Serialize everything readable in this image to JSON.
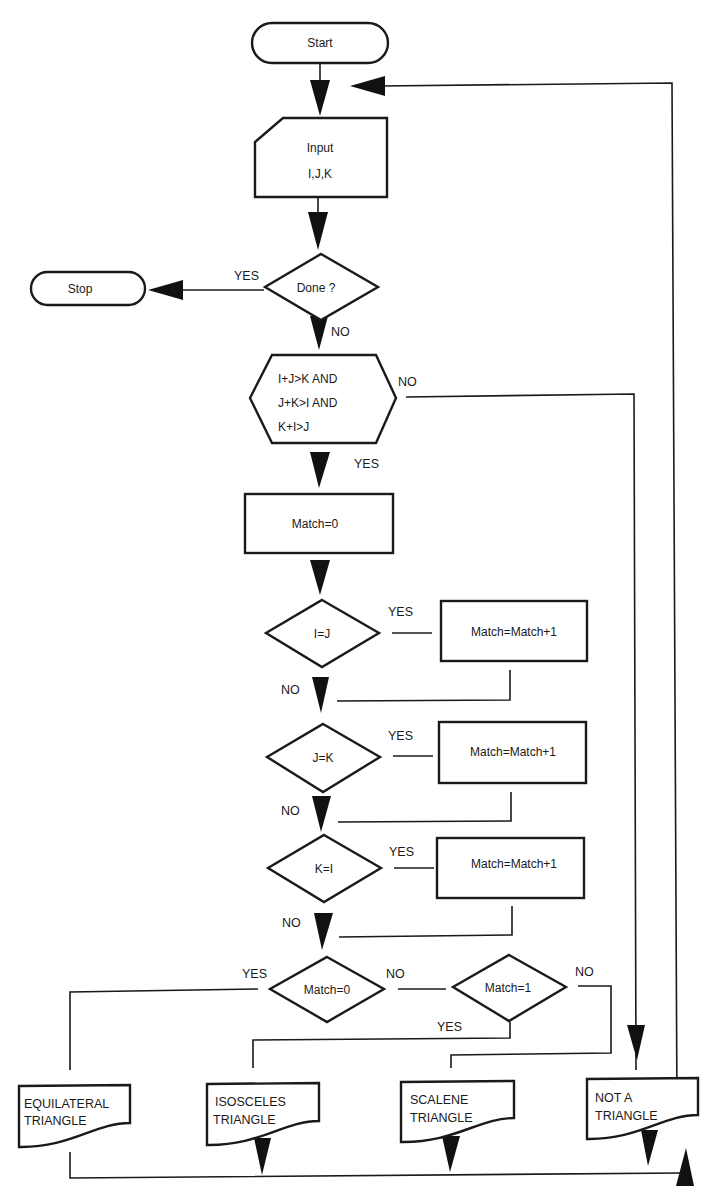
{
  "diagram": {
    "type": "flowchart",
    "colors": {
      "stroke": "#1a1a1a",
      "background": "#ffffff"
    },
    "nodes": {
      "start": {
        "shape": "terminator",
        "label": "Start"
      },
      "input": {
        "shape": "manual-input",
        "line1": "Input",
        "line2": "I,J,K"
      },
      "done": {
        "shape": "decision",
        "label": "Done ?"
      },
      "stop": {
        "shape": "terminator",
        "label": "Stop"
      },
      "triangle_check": {
        "shape": "preparation",
        "line1": "I+J>K AND",
        "line2": "J+K>I AND",
        "line3": "K+I>J"
      },
      "match_init": {
        "shape": "process",
        "label": "Match=0"
      },
      "ij": {
        "shape": "decision",
        "label": "I=J"
      },
      "inc1": {
        "shape": "process",
        "label": "Match=Match+1"
      },
      "jk": {
        "shape": "decision",
        "label": "J=K"
      },
      "inc2": {
        "shape": "process",
        "label": "Match=Match+1"
      },
      "ki": {
        "shape": "decision",
        "label": "K=I"
      },
      "inc3": {
        "shape": "process",
        "label": "Match=Match+1"
      },
      "match0": {
        "shape": "decision",
        "label": "Match=0"
      },
      "match1": {
        "shape": "decision",
        "label": "Match=1"
      },
      "equilateral": {
        "shape": "document",
        "line1": "EQUILATERAL",
        "line2": "TRIANGLE"
      },
      "isosceles": {
        "shape": "document",
        "line1": "ISOSCELES",
        "line2": "TRIANGLE"
      },
      "scalene": {
        "shape": "document",
        "line1": "SCALENE",
        "line2": "TRIANGLE"
      },
      "not_triangle": {
        "shape": "document",
        "line1": "NOT A",
        "line2": "TRIANGLE"
      }
    },
    "edge_labels": {
      "done_yes": "YES",
      "done_no": "NO",
      "check_no": "NO",
      "check_yes": "YES",
      "ij_yes": "YES",
      "ij_no": "NO",
      "jk_yes": "YES",
      "jk_no": "NO",
      "ki_yes": "YES",
      "ki_no": "NO",
      "match0_yes": "YES",
      "match0_no": "NO",
      "match1_yes": "YES",
      "match1_no": "NO"
    },
    "edges": [
      {
        "from": "start",
        "to": "input"
      },
      {
        "from": "input",
        "to": "done"
      },
      {
        "from": "done",
        "to": "stop",
        "label": "YES"
      },
      {
        "from": "done",
        "to": "triangle_check",
        "label": "NO"
      },
      {
        "from": "triangle_check",
        "to": "not_triangle",
        "label": "NO"
      },
      {
        "from": "triangle_check",
        "to": "match_init",
        "label": "YES"
      },
      {
        "from": "match_init",
        "to": "ij"
      },
      {
        "from": "ij",
        "to": "inc1",
        "label": "YES"
      },
      {
        "from": "ij",
        "to": "jk",
        "label": "NO"
      },
      {
        "from": "inc1",
        "to": "jk"
      },
      {
        "from": "jk",
        "to": "inc2",
        "label": "YES"
      },
      {
        "from": "jk",
        "to": "ki",
        "label": "NO"
      },
      {
        "from": "inc2",
        "to": "ki"
      },
      {
        "from": "ki",
        "to": "inc3",
        "label": "YES"
      },
      {
        "from": "ki",
        "to": "match0",
        "label": "NO"
      },
      {
        "from": "inc3",
        "to": "match0"
      },
      {
        "from": "match0",
        "to": "equilateral",
        "label": "YES"
      },
      {
        "from": "match0",
        "to": "match1",
        "label": "NO"
      },
      {
        "from": "match1",
        "to": "isosceles",
        "label": "YES"
      },
      {
        "from": "match1",
        "to": "scalene",
        "label": "NO"
      },
      {
        "from": "equilateral",
        "to": "input"
      },
      {
        "from": "isosceles",
        "to": "input"
      },
      {
        "from": "scalene",
        "to": "input"
      },
      {
        "from": "not_triangle",
        "to": "input"
      }
    ]
  }
}
